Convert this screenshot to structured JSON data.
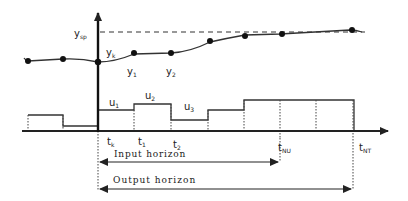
{
  "diagram": {
    "labels": {
      "setpoint": "y",
      "setpoint_sub": "sp",
      "yk": "y",
      "yk_sub": "k",
      "y1": "y",
      "y1_sub": "1",
      "y2": "y",
      "y2_sub": "2",
      "u1": "u",
      "u1_sub": "1",
      "u2": "u",
      "u2_sub": "2",
      "u3": "u",
      "u3_sub": "3",
      "tk": "t",
      "tk_sub": "k",
      "t1": "t",
      "t1_sub": "1",
      "t2": "t",
      "t2_sub": "2",
      "tNU": "t",
      "tNU_sub": "NU",
      "tNT": "t",
      "tNT_sub": "NT",
      "input_horizon": "Input horizon",
      "output_horizon": "Output horizon"
    },
    "colors": {
      "line": "#222222",
      "dashed": "#333333",
      "background": "#ffffff"
    }
  }
}
